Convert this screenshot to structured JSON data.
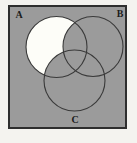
{
  "diagram": {
    "type": "venn-3-set",
    "sets": [
      {
        "label": "A"
      },
      {
        "label": "B"
      },
      {
        "label": "C"
      }
    ],
    "highlighted_region": "A only (A minus B and C) shown white",
    "shaded_regions": "all other regions inside the box shaded gray"
  },
  "colors": {
    "page-bg": "#f4f3ef",
    "box-fill": "#9b9b9b",
    "box-border": "#2e2e2e",
    "circle-stroke": "#3a3a3a",
    "highlight-fill": "#fdfdf8",
    "label-color": "#1c1c1c"
  }
}
